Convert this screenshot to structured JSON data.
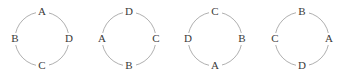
{
  "figure": {
    "name": "four-cyclic-arrangements",
    "background_color": "#ffffff",
    "stroke_color": "#9a9a9a",
    "label_color": "#3a3a3a",
    "stroke_width": 0.8,
    "radius": 27,
    "center_y": 39
  },
  "diagrams": [
    {
      "id": "circle-1",
      "center_x": 42,
      "labels": {
        "top": "A",
        "right": "D",
        "bottom": "C",
        "left": "B"
      },
      "clockwise_sequence": "A D C B"
    },
    {
      "id": "circle-2",
      "center_x": 129,
      "labels": {
        "top": "D",
        "right": "C",
        "bottom": "B",
        "left": "A"
      },
      "clockwise_sequence": "D C B A"
    },
    {
      "id": "circle-3",
      "center_x": 215,
      "labels": {
        "top": "C",
        "right": "B",
        "bottom": "A",
        "left": "D"
      },
      "clockwise_sequence": "C B A D"
    },
    {
      "id": "circle-4",
      "center_x": 302,
      "labels": {
        "top": "B",
        "right": "A",
        "bottom": "D",
        "left": "C"
      },
      "clockwise_sequence": "B A D C"
    }
  ]
}
